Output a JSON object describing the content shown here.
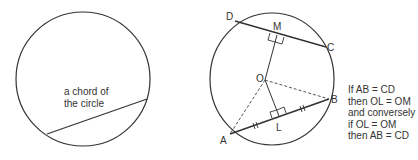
{
  "left_diagram": {
    "caption_line1": "a chord of",
    "caption_line2": "the circle"
  },
  "right_diagram": {
    "points": {
      "A": "A",
      "B": "B",
      "C": "C",
      "D": "D",
      "M": "M",
      "L": "L",
      "O": "O"
    }
  },
  "note": {
    "lines": [
      "If AB = CD",
      "then OL = OM",
      "and conversely",
      "if OL = OM",
      "then AB = CD"
    ]
  },
  "colors": {
    "stroke": "#333333",
    "background": "#ffffff"
  }
}
